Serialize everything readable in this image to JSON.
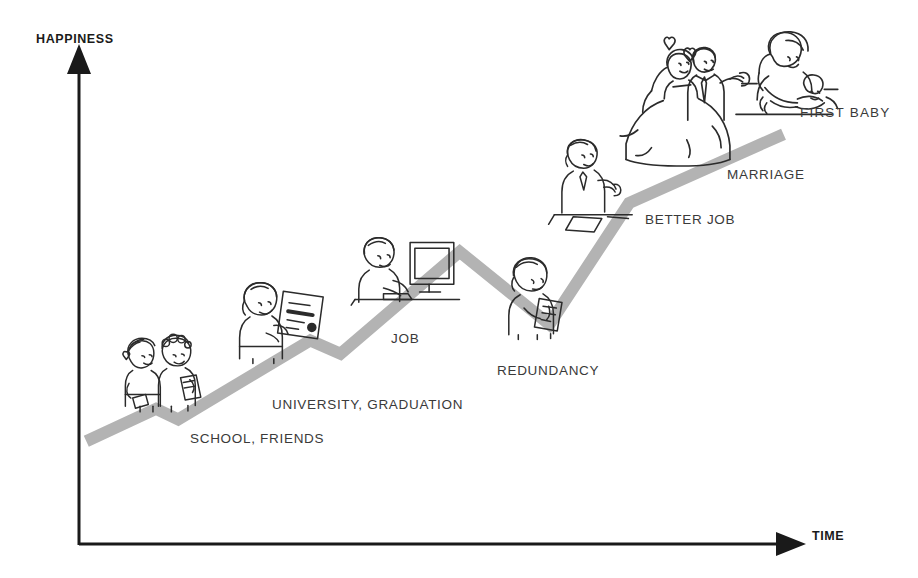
{
  "chart_data": {
    "type": "line",
    "title": "",
    "xlabel": "TIME",
    "ylabel": "HAPPINESS",
    "grid": false,
    "legend": null,
    "xlim": [
      0,
      100
    ],
    "ylim": [
      0,
      100
    ],
    "axis_ticks": {
      "x": [],
      "y": []
    },
    "series": [
      {
        "name": "happiness over time",
        "color": "#b3b3b3",
        "points": [
          {
            "x": 0.6,
            "y": 14.0,
            "label": ""
          },
          {
            "x": 10.3,
            "y": 21.7,
            "label": ""
          },
          {
            "x": 13.4,
            "y": 19.2,
            "label": ""
          },
          {
            "x": 31.8,
            "y": 38.0,
            "label": "UNIVERSITY, GRADUATION"
          },
          {
            "x": 36.0,
            "y": 34.8,
            "label": ""
          },
          {
            "x": 52.6,
            "y": 59.1,
            "label": "JOB"
          },
          {
            "x": 65.1,
            "y": 41.8,
            "label": "REDUNDANCY"
          },
          {
            "x": 76.2,
            "y": 70.7,
            "label": "BETTER JOB"
          },
          {
            "x": 97.7,
            "y": 87.1,
            "label": "MARRIAGE / FIRST BABY"
          }
        ]
      }
    ],
    "annotations": [
      {
        "text": "SCHOOL, FRIENDS",
        "near_point_index": 2
      },
      {
        "text": "UNIVERSITY, GRADUATION",
        "near_point_index": 3
      },
      {
        "text": "JOB",
        "near_point_index": 5
      },
      {
        "text": "REDUNDANCY",
        "near_point_index": 6
      },
      {
        "text": "BETTER JOB",
        "near_point_index": 7
      },
      {
        "text": "MARRIAGE",
        "near_point_index": 8
      },
      {
        "text": "FIRST BABY",
        "near_point_index": 8
      }
    ]
  },
  "axes": {
    "y_label": "HAPPINESS",
    "x_label": "TIME",
    "axis_color": "#1a1a1a"
  },
  "labels": {
    "school": "SCHOOL, FRIENDS",
    "university": "UNIVERSITY, GRADUATION",
    "job": "JOB",
    "redundancy": "REDUNDANCY",
    "better_job": "BETTER JOB",
    "marriage": "MARRIAGE",
    "first_baby": "FIRST  BABY"
  },
  "figures": [
    {
      "name": "school-friends-figure",
      "caption": "two children holding books"
    },
    {
      "name": "graduate-figure",
      "caption": "graduate holding diploma"
    },
    {
      "name": "office-worker-figure",
      "caption": "person at desk with monitor"
    },
    {
      "name": "redundancy-figure",
      "caption": "person reading a letter"
    },
    {
      "name": "better-job-figure",
      "caption": "person presenting at a desk"
    },
    {
      "name": "wedding-figure",
      "caption": "bride and groom with hearts"
    },
    {
      "name": "mother-baby-figure",
      "caption": "mother holding a baby"
    }
  ],
  "colors": {
    "line": "#b3b3b3",
    "axis": "#1a1a1a",
    "label_text": "#3a3a3a",
    "axis_text": "#1a1a1a",
    "sketch_ink": "#2b2b2b",
    "background": "#ffffff"
  }
}
